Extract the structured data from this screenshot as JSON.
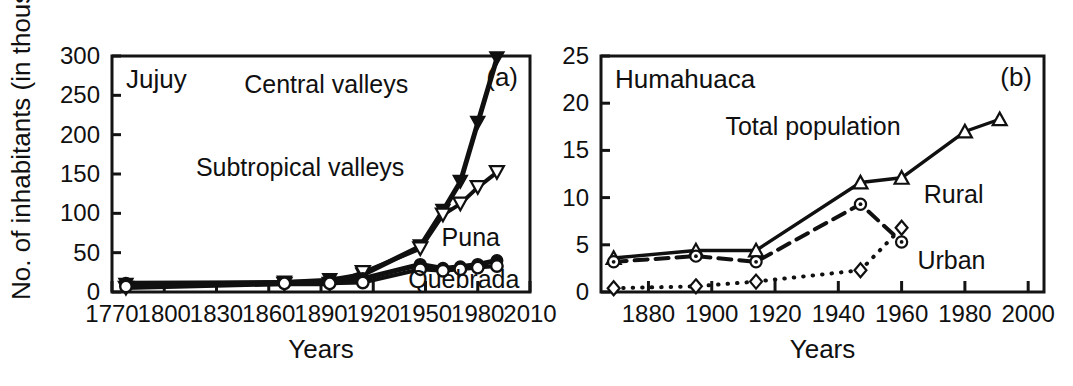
{
  "figure": {
    "y_axis_title": "No. of inhabitants (in thousands",
    "background_color": "#ffffff",
    "ink_color": "#101010"
  },
  "chart_data": [
    {
      "type": "line",
      "panel_label": "(a)",
      "title": "Jujuy",
      "xlabel": "Years",
      "ylabel": "No. of inhabitants (in thousands",
      "xlim": [
        1770,
        2010
      ],
      "ylim": [
        0,
        300
      ],
      "xticks": [
        1770,
        1800,
        1830,
        1860,
        1890,
        1920,
        1950,
        1980,
        2010
      ],
      "yticks": [
        0,
        50,
        100,
        150,
        200,
        250,
        300
      ],
      "grid": false,
      "legend": "inline-annotations",
      "series": [
        {
          "name": "Central valleys",
          "marker": "triangle-down-filled",
          "line_style": "solid",
          "line_width": 5,
          "x": [
            1778,
            1869,
            1895,
            1914,
            1947,
            1960,
            1970,
            1980,
            1991
          ],
          "values": [
            9,
            12,
            15,
            22,
            58,
            103,
            140,
            215,
            297
          ]
        },
        {
          "name": "Subtropical valleys",
          "marker": "triangle-down-open",
          "line_style": "solid",
          "line_width": 4,
          "x": [
            1778,
            1869,
            1895,
            1914,
            1947,
            1960,
            1970,
            1980,
            1991
          ],
          "values": [
            5,
            10,
            10,
            25,
            55,
            98,
            112,
            133,
            152
          ]
        },
        {
          "name": "Puna",
          "marker": "circle-filled",
          "line_style": "solid",
          "line_width": 5,
          "x": [
            1778,
            1869,
            1895,
            1914,
            1947,
            1960,
            1970,
            1980,
            1991
          ],
          "values": [
            11,
            12,
            13,
            17,
            35,
            30,
            32,
            35,
            40
          ]
        },
        {
          "name": "Quebrada",
          "marker": "circle-open",
          "line_style": "solid",
          "line_width": 4,
          "x": [
            1778,
            1869,
            1895,
            1914,
            1947,
            1960,
            1970,
            1980,
            1991
          ],
          "values": [
            7,
            11,
            11,
            12,
            29,
            27,
            29,
            31,
            33
          ]
        }
      ],
      "annotations": [
        {
          "text": "Central valleys",
          "x": 1893,
          "y": 253,
          "anchor": "middle"
        },
        {
          "text": "Subtropical valleys",
          "x": 1878,
          "y": 147,
          "anchor": "middle"
        },
        {
          "text": "Puna",
          "x": 1976,
          "y": 58,
          "anchor": "middle"
        },
        {
          "text": "Quebrada",
          "x": 1972,
          "y": 5,
          "anchor": "middle"
        }
      ]
    },
    {
      "type": "line",
      "panel_label": "(b)",
      "title": "Humahuaca",
      "xlabel": "Years",
      "ylabel": "No. of inhabitants (in thousands",
      "xlim": [
        1865,
        2005
      ],
      "ylim": [
        0,
        25
      ],
      "xticks": [
        1880,
        1900,
        1920,
        1940,
        1960,
        1980,
        2000
      ],
      "yticks": [
        0,
        5,
        10,
        15,
        20,
        25
      ],
      "grid": false,
      "legend": "inline-annotations",
      "series": [
        {
          "name": "Total population",
          "marker": "triangle-up-open",
          "line_style": "solid",
          "line_width": 3.4,
          "x": [
            1869,
            1895,
            1914,
            1947,
            1960,
            1980,
            1991
          ],
          "values": [
            3.6,
            4.4,
            4.4,
            11.6,
            12.1,
            17.0,
            18.3
          ]
        },
        {
          "name": "Rural",
          "marker": "circle-dot",
          "line_style": "dashed",
          "line_width": 4,
          "x": [
            1869,
            1895,
            1914,
            1947,
            1960
          ],
          "values": [
            3.2,
            3.8,
            3.2,
            9.3,
            5.3
          ]
        },
        {
          "name": "Urban",
          "marker": "diamond-open",
          "line_style": "dotted",
          "line_width": 4,
          "x": [
            1869,
            1895,
            1914,
            1947,
            1960
          ],
          "values": [
            0.4,
            0.6,
            1.1,
            2.3,
            6.8
          ]
        }
      ],
      "annotations": [
        {
          "text": "Total population",
          "x": 1932,
          "y": 16.6,
          "anchor": "middle"
        },
        {
          "text": "Rural",
          "x": 1967,
          "y": 9.4,
          "anchor": "start"
        },
        {
          "text": "Urban",
          "x": 1965,
          "y": 2.4,
          "anchor": "start"
        }
      ]
    }
  ]
}
